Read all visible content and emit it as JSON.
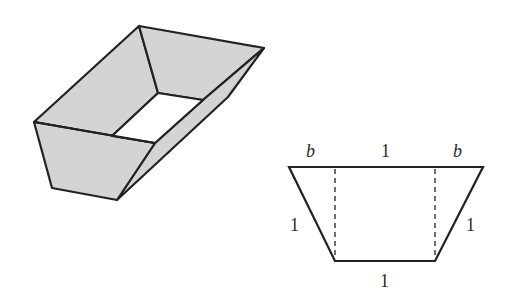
{
  "figure": {
    "colors": {
      "face_fill": "#d4d4d4",
      "stroke": "#222222",
      "opening_fill": "#ffffff"
    }
  },
  "box_3d": {
    "label": "open trough"
  },
  "cross_section": {
    "top_left_label": "b",
    "top_middle_label": "1",
    "top_right_label": "b",
    "left_side_label": "1",
    "right_side_label": "1",
    "bottom_label": "1"
  }
}
